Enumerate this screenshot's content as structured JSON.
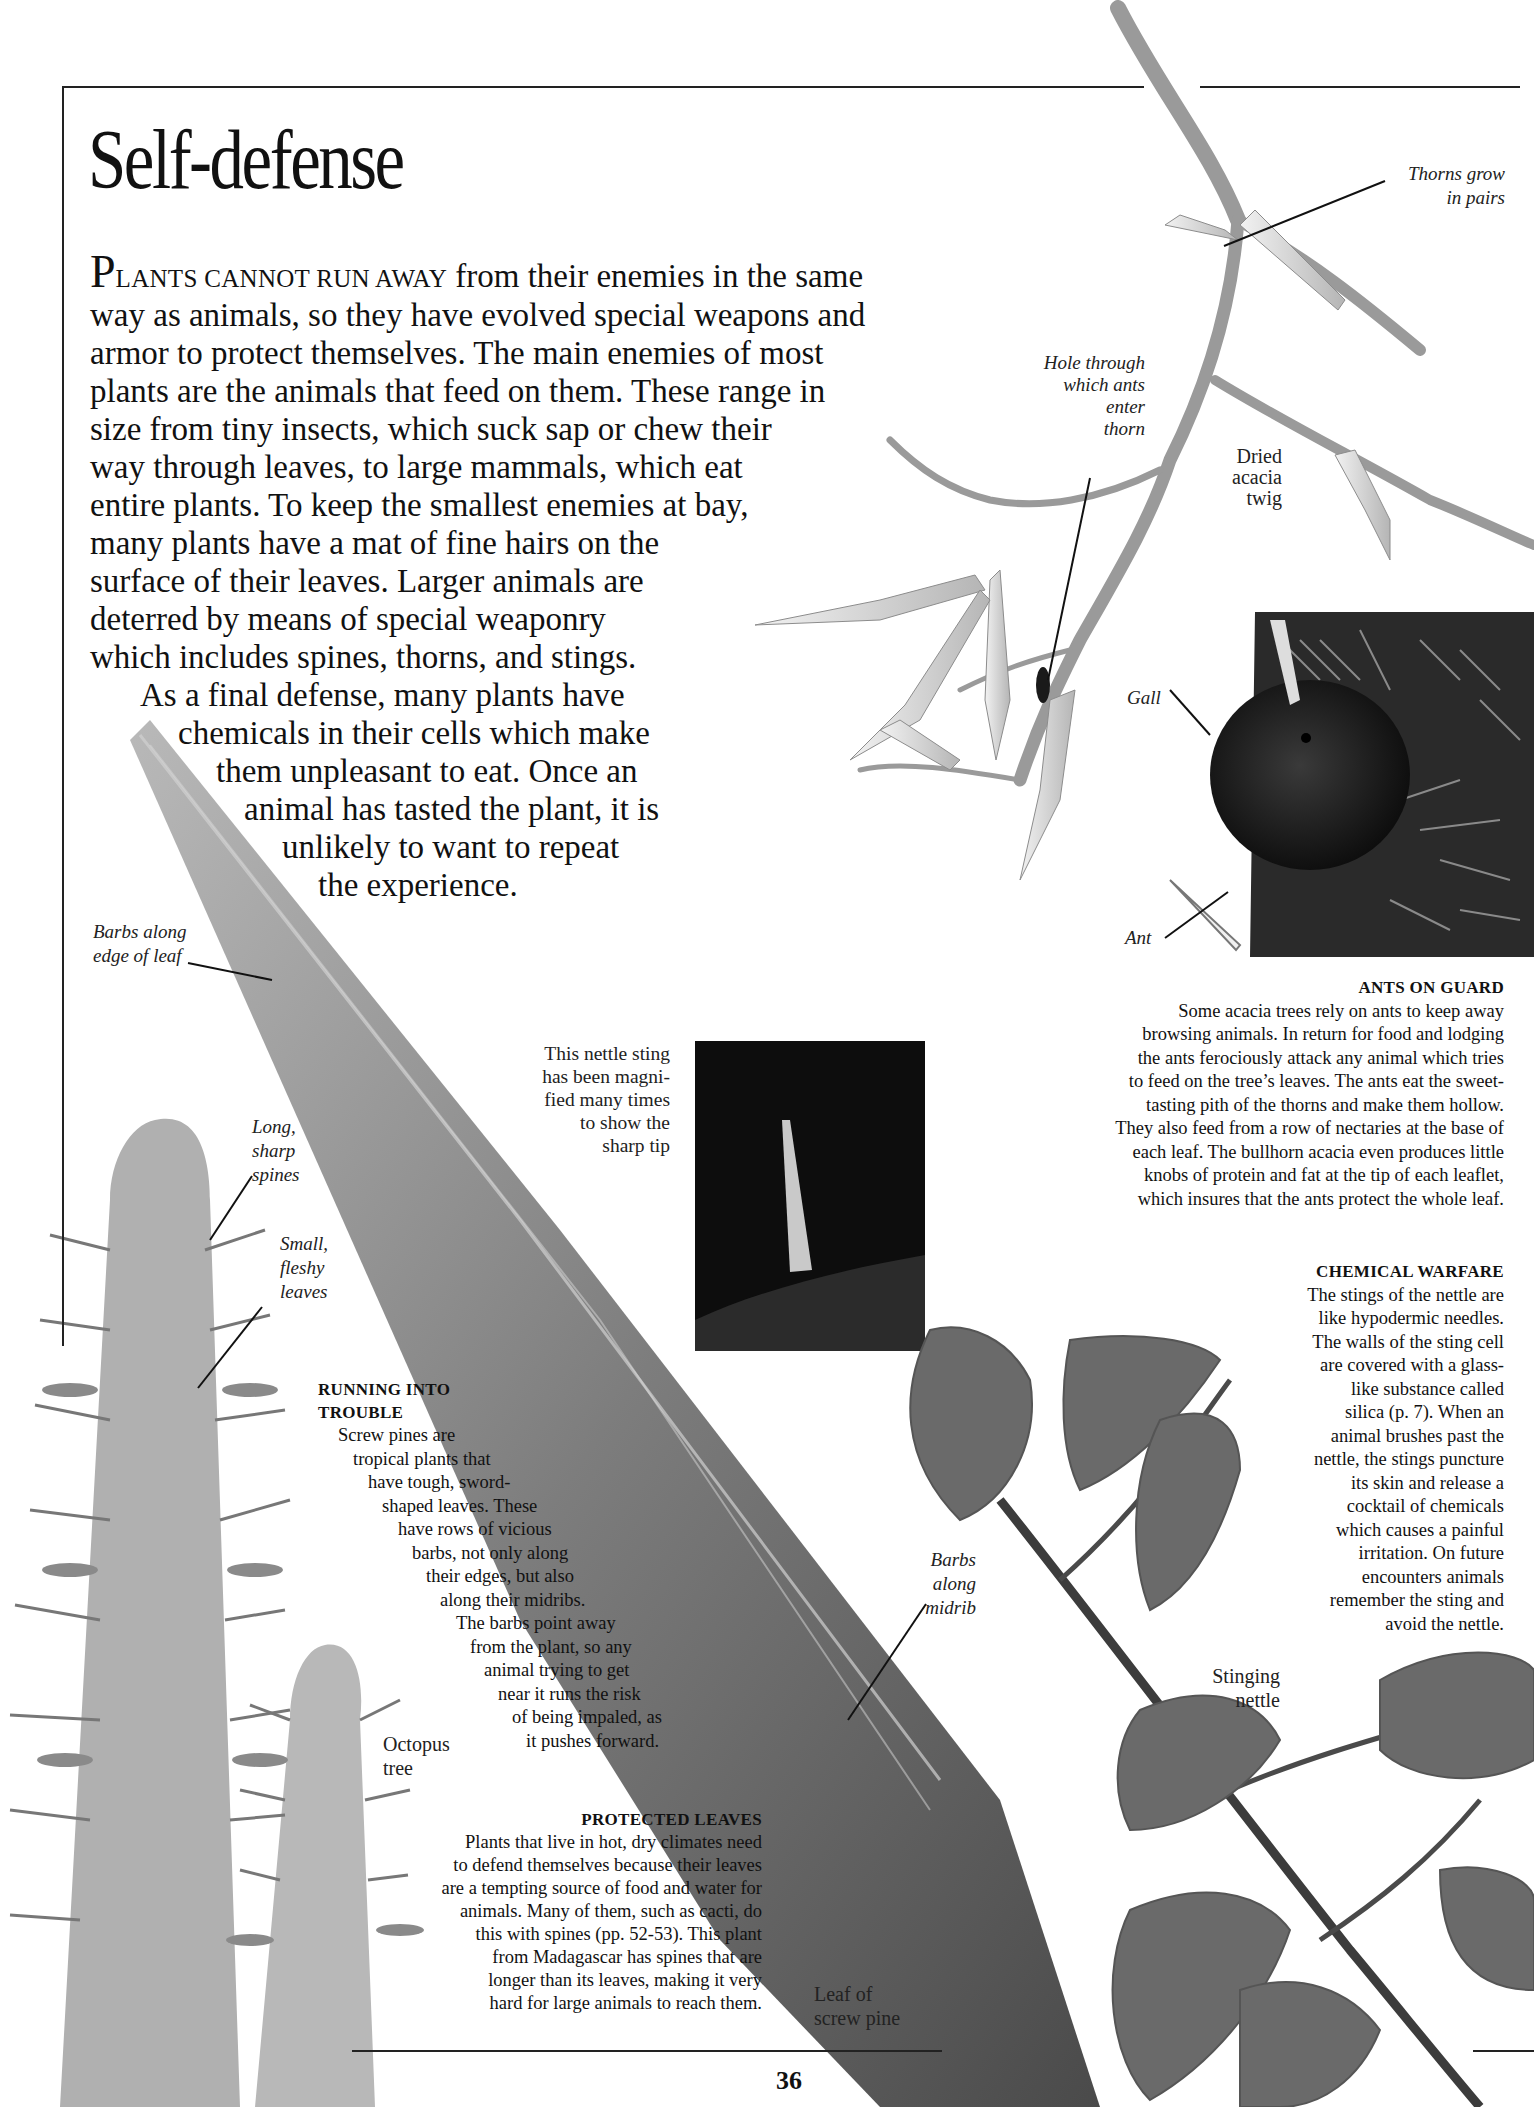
{
  "page": {
    "title": "Self-defense",
    "page_number": "36"
  },
  "intro": {
    "dropcap": "P",
    "smallcaps": "LANTS CANNOT RUN AWAY",
    "lines": [
      " from their enemies in the same",
      "way as animals, so they have evolved special weapons and",
      "armor to protect themselves. The main enemies of most",
      "plants are the animals that feed on them. These range in",
      "size from tiny insects, which suck sap or chew their",
      "way through leaves, to large mammals, which eat",
      "entire plants. To keep the smallest enemies at bay,",
      "many plants have a mat of fine hairs on the",
      "surface of their leaves. Larger animals are",
      "deterred by means of special weaponry",
      "which includes spines, thorns, and stings.",
      "As a final defense, many plants have",
      "chemicals in their cells which make",
      "them unpleasant to eat. Once an",
      "animal has tasted the plant, it is",
      "unlikely to want to repeat",
      "the experience."
    ]
  },
  "labels": {
    "thorns_pairs": [
      "Thorns grow",
      "in pairs"
    ],
    "hole_through": [
      "Hole through",
      "which ants",
      "enter",
      "thorn"
    ],
    "dried_acacia": [
      "Dried",
      "acacia",
      "twig"
    ],
    "gall": "Gall",
    "ant": "Ant",
    "barbs_edge": [
      "Barbs along",
      "edge of leaf"
    ],
    "long_spines": [
      "Long,",
      "sharp",
      "spines"
    ],
    "small_leaves": [
      "Small,",
      "fleshy",
      "leaves"
    ],
    "nettle_caption": [
      "This nettle sting",
      "has been magni-",
      "fied many times",
      "to show the",
      "sharp tip"
    ],
    "barbs_midrib": [
      "Barbs",
      "along",
      "midrib"
    ],
    "stinging_nettle": [
      "Stinging",
      "nettle"
    ],
    "octopus_tree": [
      "Octopus",
      "tree"
    ],
    "leaf_screw_pine": [
      "Leaf of",
      "screw pine"
    ]
  },
  "boxes": {
    "ants_on_guard": {
      "heading": "ANTS ON GUARD",
      "lines": [
        "Some acacia trees rely on ants to keep away",
        "browsing animals. In return for food and lodging",
        "the ants ferociously attack any animal which tries",
        "to feed on the tree’s leaves. The ants eat the sweet-",
        "tasting pith of the thorns and make them hollow.",
        "They also feed from a row of nectaries at the base of",
        "each leaf. The bullhorn acacia even produces little",
        "knobs of protein and fat at the tip of each leaflet,",
        "which insures that the ants protect the whole leaf."
      ]
    },
    "chemical_warfare": {
      "heading": "CHEMICAL WARFARE",
      "lines": [
        "The stings of the nettle are",
        "like hypodermic needles.",
        "The walls of the sting cell",
        "are covered with a glass-",
        "like substance called",
        "silica (p. 7). When an",
        "animal brushes past the",
        "nettle, the stings puncture",
        "its skin and release a",
        "cocktail of chemicals",
        "which causes a painful",
        "irritation. On future",
        "encounters animals",
        "remember the sting and",
        "avoid the nettle."
      ]
    },
    "running_into_trouble": {
      "heading": [
        "RUNNING INTO",
        "TROUBLE"
      ],
      "lines": [
        "Screw pines are",
        "tropical plants that",
        "have tough, sword-",
        "shaped leaves. These",
        "have rows of vicious",
        "barbs, not only along",
        "their edges, but also",
        "along their midribs.",
        "The barbs point away",
        "from the plant, so any",
        "animal trying to get",
        "near it runs the risk",
        "of being impaled, as",
        "it pushes forward."
      ]
    },
    "protected_leaves": {
      "heading": "PROTECTED LEAVES",
      "lines": [
        "Plants that live in hot, dry climates need",
        "to defend themselves because their leaves",
        "are a tempting source of food and water for",
        "animals. Many of them, such as cacti, do",
        "this with spines (pp. 52-53). This plant",
        "from Madagascar has spines that are",
        "longer than its leaves, making it very",
        "hard for large animals to reach them."
      ]
    }
  },
  "colors": {
    "ink": "#111111",
    "rule": "#222222",
    "photo_dark": "#0d0d0d",
    "leaf_gray": "#6f6f6f",
    "twig_gray": "#9a9a9a"
  }
}
